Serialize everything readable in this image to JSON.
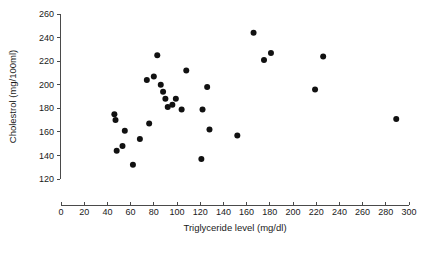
{
  "chart_data": {
    "type": "scatter",
    "title": "",
    "xlabel": "Triglyceride level (mg/dl)",
    "ylabel": "Cholestrol (mg/100ml)",
    "xlim": [
      0,
      300
    ],
    "ylim": [
      120,
      260
    ],
    "xticks": [
      0,
      20,
      40,
      60,
      80,
      100,
      120,
      140,
      160,
      180,
      200,
      220,
      240,
      260,
      280,
      300
    ],
    "yticks": [
      120,
      140,
      160,
      180,
      200,
      220,
      240,
      260
    ],
    "xtick_labels": [
      "0",
      "20",
      "40",
      "60",
      "80",
      "100",
      "120",
      "140",
      "160",
      "180",
      "200",
      "220",
      "240",
      "260",
      "280",
      "300"
    ],
    "ytick_labels": [
      "120",
      "140",
      "160",
      "180",
      "200",
      "220",
      "240",
      "260"
    ],
    "grid": false,
    "legend": null,
    "marker": "filled-circle",
    "marker_color": "#111111",
    "marker_size": 3.0,
    "points": [
      {
        "x": 46,
        "y": 175
      },
      {
        "x": 47,
        "y": 170
      },
      {
        "x": 48,
        "y": 144
      },
      {
        "x": 53,
        "y": 148
      },
      {
        "x": 55,
        "y": 161
      },
      {
        "x": 62,
        "y": 132
      },
      {
        "x": 68,
        "y": 154
      },
      {
        "x": 74,
        "y": 204
      },
      {
        "x": 76,
        "y": 167
      },
      {
        "x": 80,
        "y": 207
      },
      {
        "x": 83,
        "y": 225
      },
      {
        "x": 86,
        "y": 200
      },
      {
        "x": 88,
        "y": 194
      },
      {
        "x": 90,
        "y": 188
      },
      {
        "x": 92,
        "y": 181
      },
      {
        "x": 96,
        "y": 183
      },
      {
        "x": 99,
        "y": 188
      },
      {
        "x": 104,
        "y": 179
      },
      {
        "x": 108,
        "y": 212
      },
      {
        "x": 121,
        "y": 137
      },
      {
        "x": 122,
        "y": 179
      },
      {
        "x": 126,
        "y": 198
      },
      {
        "x": 128,
        "y": 162
      },
      {
        "x": 152,
        "y": 157
      },
      {
        "x": 166,
        "y": 244
      },
      {
        "x": 175,
        "y": 221
      },
      {
        "x": 181,
        "y": 227
      },
      {
        "x": 219,
        "y": 196
      },
      {
        "x": 226,
        "y": 224
      },
      {
        "x": 289,
        "y": 171
      }
    ]
  }
}
